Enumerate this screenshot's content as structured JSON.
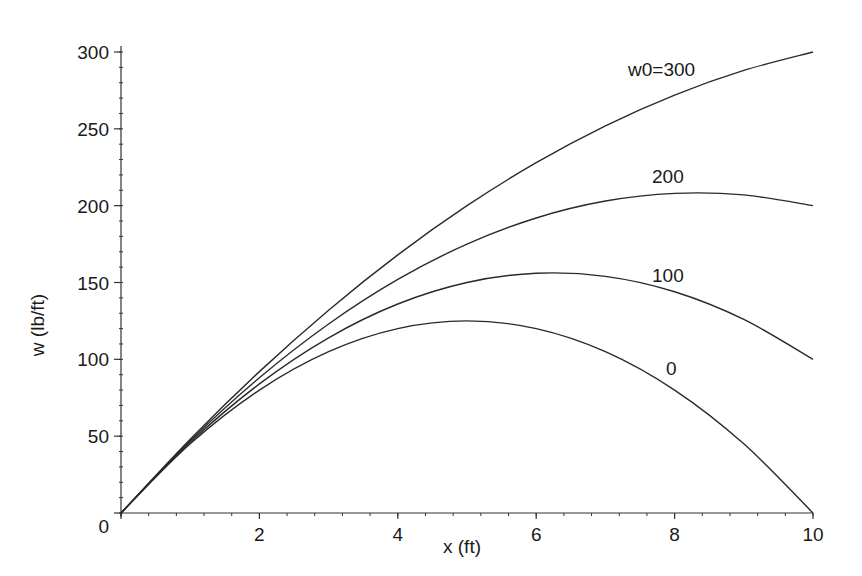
{
  "chart_data": {
    "type": "line",
    "title": "",
    "xlabel": "x (ft)",
    "ylabel": "w (lb/ft)",
    "xlim": [
      0,
      10
    ],
    "ylim": [
      0,
      300
    ],
    "grid": false,
    "legend_position": "inline labels at curve ends",
    "x_ticks": [
      2,
      4,
      6,
      8,
      10
    ],
    "y_ticks": [
      0,
      50,
      100,
      150,
      200,
      250,
      300
    ],
    "x": [
      0,
      1,
      2,
      3,
      4,
      5,
      6,
      7,
      8,
      9,
      10
    ],
    "series": [
      {
        "name": "w0=300",
        "label": "w0=300",
        "values": [
          0,
          48,
          92,
          132,
          168,
          200,
          228,
          252,
          272,
          288,
          300
        ]
      },
      {
        "name": "w0=200",
        "label": "200",
        "values": [
          0,
          47,
          88,
          123,
          152,
          175,
          192,
          203,
          208,
          207,
          200
        ]
      },
      {
        "name": "w0=100",
        "label": "100",
        "values": [
          0,
          46,
          84,
          114,
          136,
          150,
          156,
          154,
          144,
          126,
          100
        ]
      },
      {
        "name": "w0=0",
        "label": "0",
        "values": [
          0,
          45,
          80,
          105,
          120,
          125,
          120,
          105,
          80,
          45,
          0
        ]
      }
    ]
  },
  "axes": {
    "x_tick_labels": [
      "2",
      "4",
      "6",
      "8",
      "10"
    ],
    "y_tick_labels": [
      "0",
      "50",
      "100",
      "150",
      "200",
      "250",
      "300"
    ],
    "x_title": "x (ft)",
    "y_title": "w (lb/ft)"
  },
  "labels": {
    "w300": "w0=300",
    "w200": "200",
    "w100": "100",
    "w0": "0"
  },
  "colors": {
    "line": "#2a2a2a",
    "axis": "#333333",
    "background": "#ffffff"
  }
}
